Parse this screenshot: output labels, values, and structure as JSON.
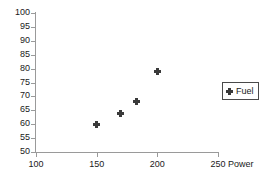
{
  "chart_data": {
    "type": "scatter",
    "title": "",
    "subtitle": "",
    "xlabel": "Power",
    "ylabel": "",
    "xlim": [
      100,
      250
    ],
    "ylim": [
      50,
      100
    ],
    "xticks": [
      100,
      150,
      200,
      250
    ],
    "xtick_labels": [
      "100",
      "150",
      "200",
      "250"
    ],
    "yticks": [
      50,
      55,
      60,
      65,
      70,
      75,
      80,
      85,
      90,
      95,
      100
    ],
    "ytick_labels": [
      "50",
      "55",
      "60",
      "65",
      "70",
      "75",
      "80",
      "85",
      "90",
      "95",
      "100"
    ],
    "grid": false,
    "legend_position": "right",
    "series": [
      {
        "name": "Fuel",
        "marker": "diamond",
        "color": "#3a3a3a",
        "points": [
          {
            "x": 150,
            "y": 60
          },
          {
            "x": 170,
            "y": 64
          },
          {
            "x": 183,
            "y": 68
          },
          {
            "x": 200,
            "y": 79
          }
        ]
      }
    ]
  },
  "legend": {
    "entries": [
      {
        "label": "Fuel"
      }
    ]
  },
  "axes": {
    "x_title": "Power"
  },
  "colors": {
    "marker": "#3a3a3a",
    "axis": "#9a9a9a",
    "text": "#1a1a1a",
    "legend_border": "#4a4a4a",
    "background": "#ffffff"
  }
}
